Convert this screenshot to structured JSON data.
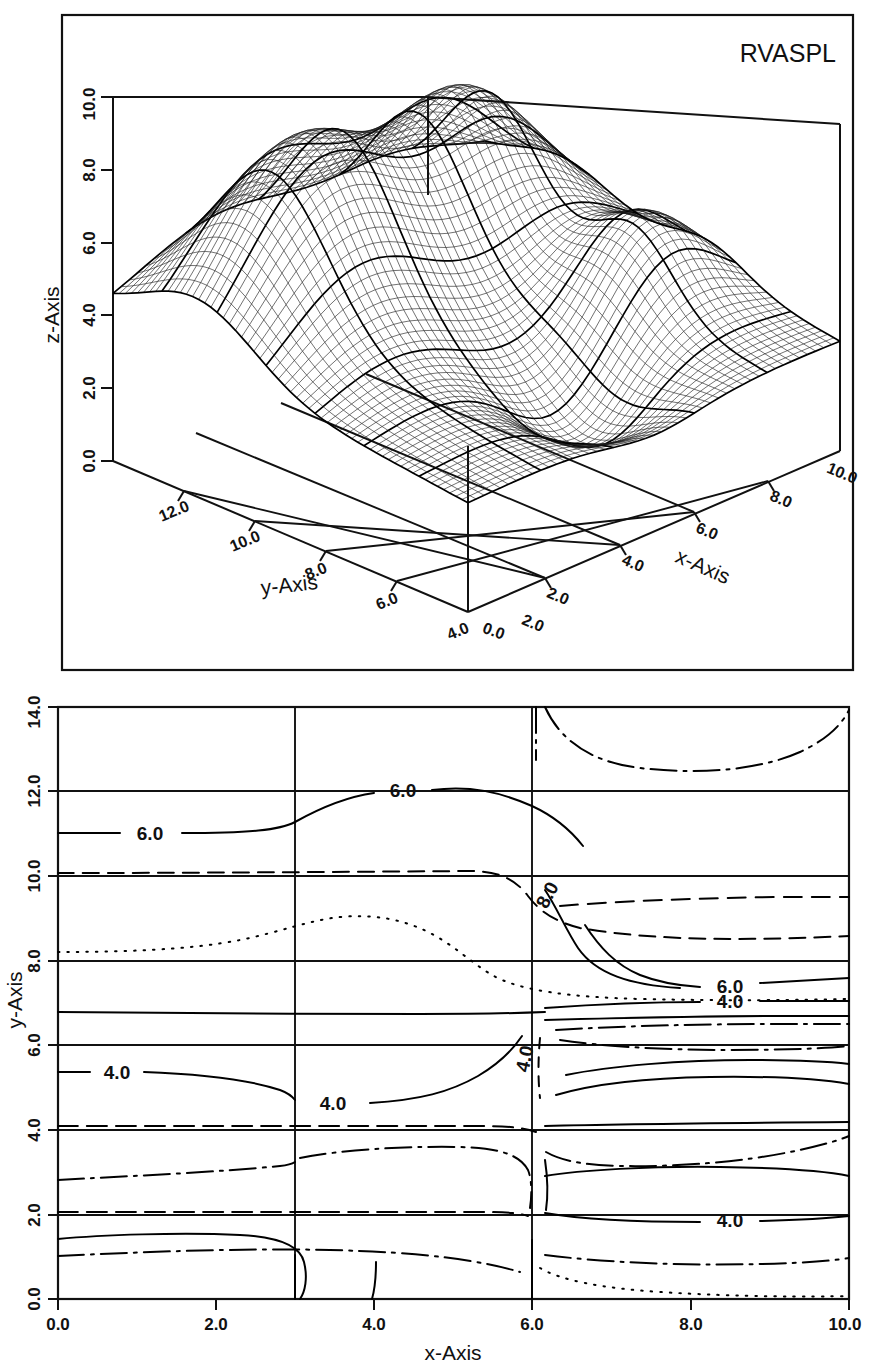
{
  "figure": {
    "title": "RVASPL",
    "panels": [
      "surface-3d",
      "contour-map"
    ]
  },
  "surface_panel": {
    "title": "RVASPL",
    "z_axis": {
      "name": "z-Axis",
      "ticks": [
        "0.0",
        "2.0",
        "4.0",
        "6.0",
        "8.0",
        "10.0"
      ]
    },
    "y_axis": {
      "name": "y-Axis",
      "ticks": [
        "12.0",
        "10.0",
        "8.0",
        "6.0",
        "4.0",
        "2.0"
      ]
    },
    "x_axis": {
      "name": "x-Axis",
      "ticks": [
        "2.0",
        "4.0",
        "6.0",
        "8.0",
        "10.0"
      ]
    },
    "origin_label": "0.0"
  },
  "contour_panel": {
    "x_axis": {
      "name": "x-Axis",
      "ticks": [
        "0.0",
        "2.0",
        "4.0",
        "6.0",
        "8.0",
        "10.0"
      ]
    },
    "y_axis": {
      "name": "y-Axis",
      "ticks": [
        "0.0",
        "2.0",
        "4.0",
        "6.0",
        "8.0",
        "10.0",
        "12.0",
        "14.0"
      ]
    },
    "labels": [
      {
        "text": "6.0",
        "x": 1.15,
        "y": 11.35
      },
      {
        "text": "6.0",
        "x": 4.2,
        "y": 11.65
      },
      {
        "text": "8.0",
        "x": 5.95,
        "y": 9.72
      },
      {
        "text": "6.0",
        "x": 8.05,
        "y": 8.32
      },
      {
        "text": "4.0",
        "x": 8.15,
        "y": 7.08
      },
      {
        "text": "4.0",
        "x": 0.95,
        "y": 5.35
      },
      {
        "text": "4.0",
        "x": 3.3,
        "y": 4.85
      },
      {
        "text": "4.0",
        "x": 5.7,
        "y": 5.72
      },
      {
        "text": "4.0",
        "x": 8.05,
        "y": 2.58
      }
    ]
  },
  "chart_data": {
    "type": "line",
    "title": "RVASPL",
    "subtitle": "",
    "xlabel": "x-Axis",
    "ylabel": "y-Axis",
    "zlabel": "z-Axis",
    "grid": true,
    "legend_position": "none",
    "surface": {
      "type": "wireframe-surface-3d",
      "xlim": [
        0.0,
        10.0
      ],
      "ylim": [
        0.0,
        14.0
      ],
      "zlim": [
        0.0,
        10.0
      ],
      "xticks": [
        0.0,
        2.0,
        4.0,
        6.0,
        8.0,
        10.0
      ],
      "yticks": [
        2.0,
        4.0,
        6.0,
        8.0,
        10.0,
        12.0
      ],
      "zticks": [
        0.0,
        2.0,
        4.0,
        6.0,
        8.0,
        10.0
      ],
      "description": "Smooth undulating surface with a broad ridge/peak reaching about z=8 near the rear, falling to about z=2-3 at the front valley"
    },
    "contours": {
      "type": "contour",
      "xlim": [
        0.0,
        10.0
      ],
      "ylim": [
        0.0,
        14.0
      ],
      "xticks": [
        0.0,
        2.0,
        4.0,
        6.0,
        8.0,
        10.0
      ],
      "yticks": [
        0.0,
        2.0,
        4.0,
        6.0,
        8.0,
        10.0,
        12.0,
        14.0
      ],
      "levels": [
        4.0,
        6.0,
        8.0
      ],
      "labeled_levels": [
        "4.0",
        "6.0",
        "8.0"
      ],
      "line_styles": [
        "solid",
        "dashed",
        "dotted",
        "dash-dot"
      ]
    }
  }
}
